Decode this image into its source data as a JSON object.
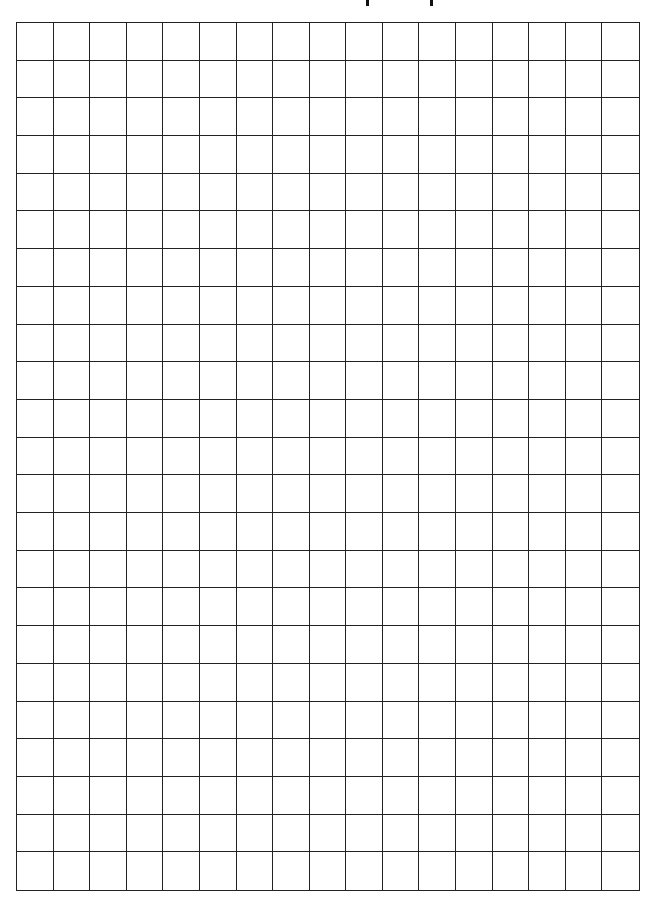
{
  "page": {
    "type": "graph-paper",
    "title_visible": false,
    "title_remnant_marks": [
      367,
      431
    ]
  },
  "grid": {
    "columns": 17,
    "rows": 23,
    "line_color": "#222222",
    "background": "#ffffff"
  }
}
